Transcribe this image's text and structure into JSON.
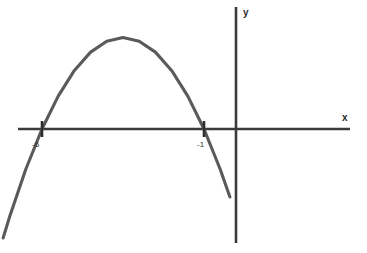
{
  "figure": {
    "background_color": "#ffffff",
    "width": 367,
    "height": 253
  },
  "axes": {
    "x_axis_label": "x",
    "y_axis_label": "y",
    "axis_color": "#3a3a3a",
    "x_axis_pixel_y": 129,
    "y_axis_pixel_x": 236,
    "x_axis_pixel_start": 18,
    "x_axis_pixel_end": 350,
    "y_axis_pixel_start": 7,
    "y_axis_pixel_end": 243
  },
  "tick_labels": {
    "left_root": "-6",
    "right_root": "-1"
  },
  "chart_data": {
    "type": "line",
    "title": "",
    "xlabel": "x",
    "ylabel": "y",
    "curve_color": "#5a5a5a",
    "grid": false,
    "legend": "none",
    "series": [
      {
        "name": "parabola",
        "shape": "upward parabola",
        "roots": [
          -6,
          -1
        ],
        "vertex": [
          -3.5,
          -6.25
        ],
        "equation": "y = (x + 6)(x + 1)",
        "x": [
          -7.2,
          -7.0,
          -6.5,
          -6.0,
          -5.5,
          -5.0,
          -4.5,
          -4.0,
          -3.5,
          -3.0,
          -2.5,
          -2.0,
          -1.5,
          -1.0,
          -0.5,
          -0.2
        ],
        "y": [
          7.44,
          6.0,
          2.75,
          0.0,
          -2.25,
          -4.0,
          -5.25,
          -6.0,
          -6.25,
          -6.0,
          -5.25,
          -4.0,
          -2.25,
          0.0,
          2.75,
          4.64
        ]
      }
    ],
    "annotations": [
      {
        "text": "-6",
        "x": -6,
        "y": 0,
        "role": "x-intercept-label"
      },
      {
        "text": "-1",
        "x": -1,
        "y": 0,
        "role": "x-intercept-label"
      }
    ],
    "xlim": [
      -8.7,
      4.6
    ],
    "ylim": [
      -9.0,
      8.6
    ],
    "x_intercept_markers": [
      -6,
      -1
    ]
  }
}
